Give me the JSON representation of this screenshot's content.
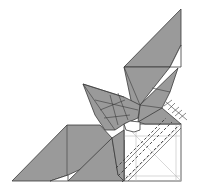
{
  "diagram": {
    "colors": {
      "colored_side": "#9a9a9a",
      "white_side": "#ffffff",
      "line": "#3a3a3a",
      "light_crease": "#bdbdbd"
    },
    "symbols": [
      "valley-fold-lines",
      "x-ray-hatched-edge"
    ],
    "parts": [
      "top-flap",
      "middle-flap",
      "left-flap",
      "lower-left-flap",
      "white-square-base"
    ]
  }
}
